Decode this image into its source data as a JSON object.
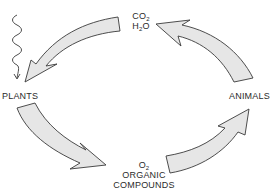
{
  "diagram": {
    "type": "cycle",
    "nodes": {
      "top": {
        "line1_base": "CO",
        "line1_sub": "2",
        "line2_pre": "H",
        "line2_sub": "2",
        "line2_post": "O"
      },
      "left": {
        "label": "PLANTS"
      },
      "right": {
        "label": "ANIMALS"
      },
      "bottom": {
        "line1_base": "O",
        "line1_sub": "2",
        "line2": "ORGANIC",
        "line3": "COMPOUNDS"
      }
    },
    "arrows": [
      {
        "from": "CO2 H2O",
        "to": "PLANTS",
        "direction": "counterclockwise"
      },
      {
        "from": "PLANTS",
        "to": "O2 ORGANIC COMPOUNDS",
        "direction": "counterclockwise"
      },
      {
        "from": "O2 ORGANIC COMPOUNDS",
        "to": "ANIMALS",
        "direction": "counterclockwise"
      },
      {
        "from": "ANIMALS",
        "to": "CO2 H2O",
        "direction": "counterclockwise"
      }
    ],
    "energy_input": {
      "symbol": "wavy-arrow",
      "target": "PLANTS"
    },
    "colors": {
      "arrow_fill": "#e6e6e6",
      "arrow_stroke": "#3a3a3a",
      "text": "#2b2b2b",
      "background": "#ffffff"
    }
  }
}
